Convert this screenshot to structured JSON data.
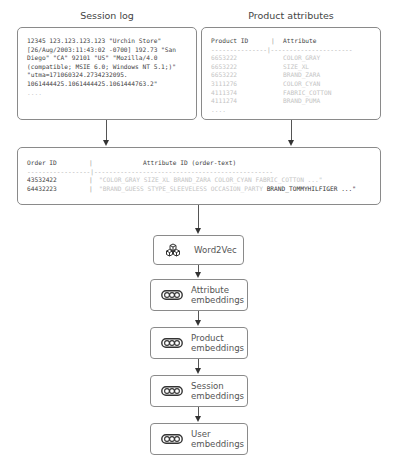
{
  "session_log": {
    "title": "Session log",
    "lines": [
      "12345 123.123.123.123 \"Urchin Store\"",
      "[26/Aug/2003:11:43:02 -0700] 192.73 \"San",
      "Diego\" \"CA\" 92101 \"US\" \"Mozilla/4.0",
      "(compatible; MSIE 6.0; Windows NT 5.1;)\"",
      "\"utma=171060324.2734232095.",
      "1061444425.1061444425.1061444763.2\"",
      "...."
    ]
  },
  "product_attributes": {
    "title": "Product attributes",
    "header": {
      "col1": "Product ID",
      "sep": "|",
      "col2": "Attribute"
    },
    "divider": "---------------|----------------------",
    "rows": [
      {
        "id": "6653222",
        "attr": "COLOR_GRAY"
      },
      {
        "id": "6653222",
        "attr": "SIZE_XL"
      },
      {
        "id": "6653222",
        "attr": "BRAND_ZARA"
      },
      {
        "id": "3111276",
        "attr": "COLOR_CYAN"
      },
      {
        "id": "4111374",
        "attr": "FABRIC_COTTON"
      },
      {
        "id": "4111274",
        "attr": "BRAND_PUMA"
      }
    ],
    "ellipsis": "...."
  },
  "orders": {
    "header": {
      "col1": "Order ID",
      "sep": "|",
      "col2": "Attribute ID (order-text)"
    },
    "divider": "-----------------|------------------------------------------------",
    "rows": [
      {
        "id": "43532422",
        "text_faded": "\"COLOR_GRAY SIZE_XL BRAND_ZARA COLOR_CYAN FABRIC_COTTON ...\"",
        "text_dark": ""
      },
      {
        "id": "64432223",
        "text_faded": "\"BRAND_GUESS STYPE_SLEEVELESS OCCASION_PARTY ",
        "text_dark": "BRAND_TOMMYHILFIGER ...\""
      }
    ]
  },
  "pipeline": [
    {
      "label": "Word2Vec",
      "icon": "cubes-icon"
    },
    {
      "label1": "Attribute",
      "label2": "embeddings",
      "icon": "embedding-vector-icon"
    },
    {
      "label1": "Product",
      "label2": "embeddings",
      "icon": "embedding-vector-icon"
    },
    {
      "label1": "Session",
      "label2": "embeddings",
      "icon": "embedding-vector-icon"
    },
    {
      "label1": "User",
      "label2": "embeddings",
      "icon": "embedding-vector-icon"
    }
  ]
}
